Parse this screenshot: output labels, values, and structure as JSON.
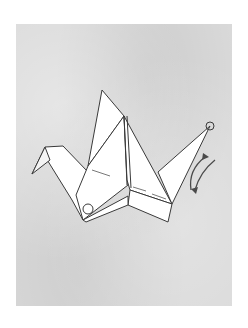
{
  "image": {
    "subject": "origami crane folding step",
    "background_color": "#ffffff",
    "paper_color": "#d9d9d9",
    "crane_fill": "#ffffff",
    "line_color": "#3a3a3a",
    "elements": [
      {
        "name": "crane",
        "description": "white folded paper crane outline"
      },
      {
        "name": "head-circle-marker",
        "description": "small circle at head tip"
      },
      {
        "name": "body-circle-marker",
        "description": "small circle at lower left of body"
      },
      {
        "name": "fold-direction-arrows",
        "description": "two curved arrows pointing up and down beside neck"
      }
    ]
  }
}
